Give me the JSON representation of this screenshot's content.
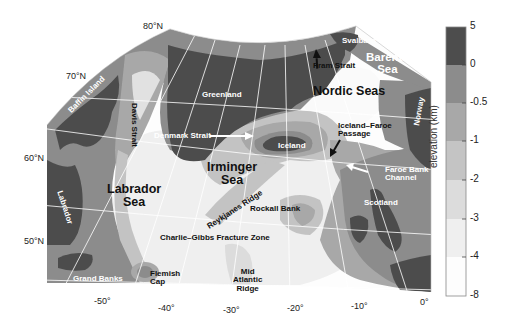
{
  "map": {
    "title": "North Atlantic and Nordic Seas bathymetry",
    "colors": {
      "land": "#4d4d4d",
      "elev_0_to_-0.5": "#8c8c8c",
      "elev_-0.5_to_-1": "#a8a8a8",
      "elev_-1_to_-2": "#c4c4c4",
      "elev_-2_to_-3": "#dcdcdc",
      "elev_-3_to_-4": "#efefef",
      "elev_-4_to_-8": "#fdfdfd",
      "graticule": "#ffffff",
      "contour": "#9a9a9a"
    },
    "latitude_labels": [
      "80°N",
      "70°N",
      "60°N",
      "50°N"
    ],
    "longitude_labels": [
      "-50°",
      "-40°",
      "-30°",
      "-20°",
      "-10°",
      "0°"
    ],
    "place_labels": {
      "svalbard": "Svalbard",
      "barents_sea": "Barents\nSea",
      "fram_strait": "Fram Strait",
      "nordic_seas": "Nordic Seas",
      "greenland": "Greenland",
      "baffin_island": "Baffin Island",
      "davis_strait": "Davis Strait",
      "denmark_strait": "Denmark Strait",
      "iceland": "Iceland",
      "iceland_faroe_passage": "Iceland–Faroe\nPassage",
      "norway": "Norway",
      "irminger_sea": "Irminger\nSea",
      "labrador_sea": "Labrador\nSea",
      "labrador": "Labrador",
      "reykjanes_ridge": "Reykjanes Ridge",
      "faroe_bank_channel": "Faroe Bank\nChannel",
      "rockall_bank": "Rockall Bank",
      "scotland": "Scotland",
      "charlie_gibbs": "Charlie–Gibbs Fracture Zone",
      "grand_banks": "Grand Banks",
      "flemish_cap": "Flemish\nCap",
      "mid_atlantic_ridge": "Mid\nAtlantic\nRidge"
    }
  },
  "colorbar": {
    "title": "elevation (km)",
    "ticks": [
      "5",
      "0",
      "-0.5",
      "-1",
      "-2",
      "-3",
      "-4",
      "-8"
    ],
    "bins": [
      {
        "from": 5,
        "to": 0,
        "color": "#4d4d4d"
      },
      {
        "from": 0,
        "to": -0.5,
        "color": "#8c8c8c"
      },
      {
        "from": -0.5,
        "to": -1,
        "color": "#a8a8a8"
      },
      {
        "from": -1,
        "to": -2,
        "color": "#c4c4c4"
      },
      {
        "from": -2,
        "to": -3,
        "color": "#dcdcdc"
      },
      {
        "from": -3,
        "to": -4,
        "color": "#efefef"
      },
      {
        "from": -4,
        "to": -8,
        "color": "#fdfdfd"
      }
    ]
  }
}
